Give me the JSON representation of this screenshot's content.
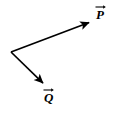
{
  "figure": {
    "background_color": "#ffffff",
    "stroke_color": "#000000",
    "label_color": "#000000",
    "width": 115,
    "height": 115,
    "origin": {
      "x": 11,
      "y": 52
    },
    "vectors": [
      {
        "id": "p",
        "label": "P",
        "notation": "vector-arrow-overbar",
        "start": {
          "x": 11,
          "y": 52
        },
        "end": {
          "x": 93,
          "y": 21
        },
        "arrowhead": "solid-filled-triangle",
        "direction": "up-right",
        "label_position": {
          "x": 96,
          "y": 6
        }
      },
      {
        "id": "q",
        "label": "Q",
        "notation": "vector-arrow-overbar",
        "start": {
          "x": 11,
          "y": 52
        },
        "end": {
          "x": 46,
          "y": 86
        },
        "arrowhead": "solid-filled-triangle",
        "direction": "down-right",
        "label_position": {
          "x": 44,
          "y": 89
        }
      }
    ]
  },
  "chart_data": {
    "type": "diagram",
    "title": "",
    "xlabel": "",
    "ylabel": "",
    "series": [
      {
        "name": "P",
        "start": [
          11,
          52
        ],
        "end": [
          93,
          21
        ]
      },
      {
        "name": "Q",
        "start": [
          11,
          52
        ],
        "end": [
          46,
          86
        ]
      }
    ]
  }
}
